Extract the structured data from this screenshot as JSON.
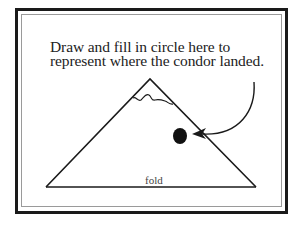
{
  "instruction": {
    "line1": "Draw and fill in circle here to",
    "line2": "represent where the condor landed."
  },
  "diagram": {
    "shape": "mountain-triangle",
    "fold_label": "fold",
    "marker": "filled-circle",
    "pointer": "curved-arrow",
    "colors": {
      "ink": "#1a1a1a",
      "inner_border": "#9a9a9a",
      "background": "#ffffff"
    }
  }
}
